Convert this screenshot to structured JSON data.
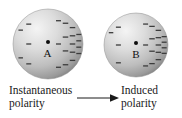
{
  "figure": {
    "background_color": "#ffffff"
  },
  "spheres": [
    {
      "id": "sphere-a",
      "label": "A",
      "cx": 47.5,
      "cy": 44,
      "r": 35,
      "highlight_color": "#f2f2f2",
      "mid_color": "#c9c9c9",
      "shadow_color": "#7f7f7f",
      "charge_symbol": "minus",
      "charge_side": "right",
      "charge_count": 22,
      "charge_color": "#3c3c3c"
    },
    {
      "id": "sphere-b",
      "label": "B",
      "cx": 136,
      "cy": 45,
      "r": 32,
      "highlight_color": "#f2f2f2",
      "mid_color": "#c9c9c9",
      "shadow_color": "#7f7f7f",
      "charge_symbol": "minus",
      "charge_side": "right",
      "charge_count": 20,
      "charge_color": "#3c3c3c"
    }
  ],
  "captions": {
    "left": {
      "line1": "Instantaneous",
      "line2": "polarity"
    },
    "right": {
      "line1": "Induced",
      "line2": "polarity"
    }
  },
  "arrow": {
    "name": "rightward-arrow",
    "x1": 77,
    "x2": 116,
    "y": 98,
    "color": "#1a1a1a",
    "direction": "right"
  }
}
